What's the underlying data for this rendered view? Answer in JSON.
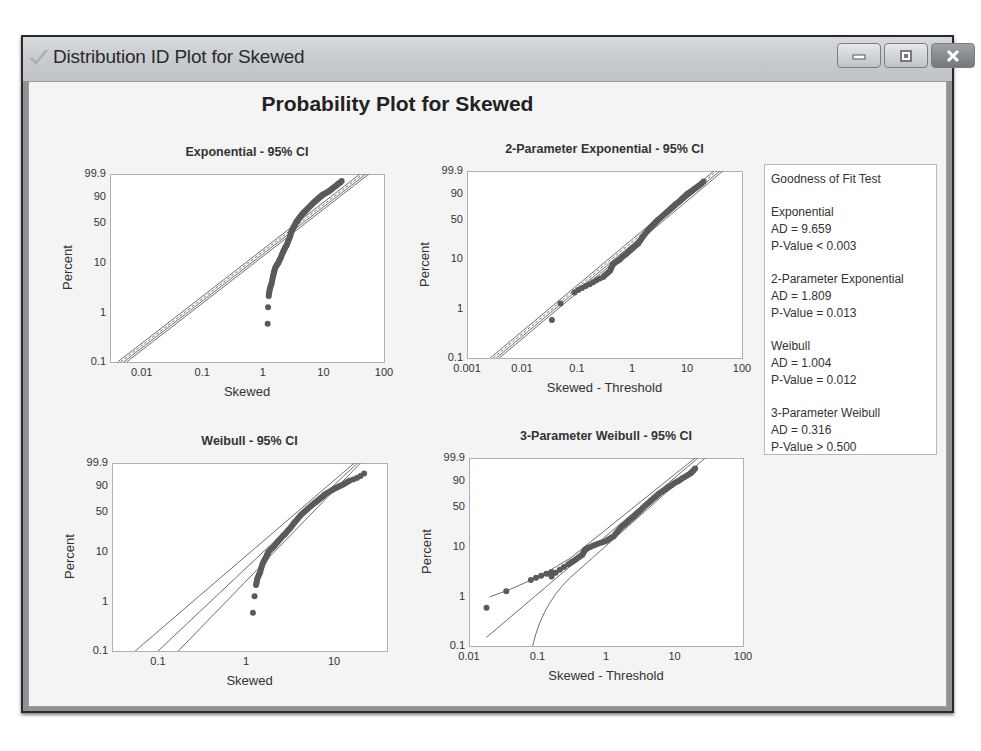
{
  "window": {
    "title": "Distribution ID Plot for Skewed",
    "icon": "checkmark-icon",
    "controls": {
      "minimize": "minimize-icon",
      "maximize": "maximize-icon",
      "close": "close-icon"
    }
  },
  "main_title": "Probability Plot for Skewed",
  "goodness_of_fit": {
    "title": "Goodness of Fit Test",
    "tests": [
      {
        "name": "Exponential",
        "ad": "AD = 9.659",
        "p": "P-Value < 0.003"
      },
      {
        "name": "2-Parameter Exponential",
        "ad": "AD = 1.809",
        "p": "P-Value = 0.013"
      },
      {
        "name": "Weibull",
        "ad": "AD = 1.004",
        "p": "P-Value = 0.012"
      },
      {
        "name": "3-Parameter Weibull",
        "ad": "AD = 0.316",
        "p": "P-Value > 0.500"
      }
    ]
  },
  "colors": {
    "points": "#5a5a5a",
    "lines": "#6e6e6e",
    "frame": "#b0b0b0"
  },
  "chart_data": [
    {
      "type": "scatter",
      "title": "Exponential - 95% CI",
      "xlabel": "Skewed",
      "ylabel": "Percent",
      "xscale": "log",
      "xlim": [
        0.003,
        100
      ],
      "xticks": [
        "0.01",
        "0.1",
        "1",
        "10",
        "100"
      ],
      "xtick_values": [
        0.01,
        0.1,
        1,
        10,
        100
      ],
      "yticks": [
        "0.1",
        "1",
        "10",
        "50",
        "90",
        "99.9"
      ],
      "ytick_values": [
        0.1,
        1,
        10,
        50,
        90,
        99.9
      ],
      "fit_line": {
        "x": [
          0.0045,
          45
        ],
        "note": "fitted line with narrow 95% CI band"
      },
      "points": [
        [
          1.2,
          0.6
        ],
        [
          1.22,
          1.3
        ],
        [
          1.25,
          2.2
        ],
        [
          1.3,
          3
        ],
        [
          1.4,
          4
        ],
        [
          1.5,
          6
        ],
        [
          1.6,
          8
        ],
        [
          1.8,
          10
        ],
        [
          2,
          13
        ],
        [
          2.2,
          17
        ],
        [
          2.5,
          22
        ],
        [
          2.8,
          30
        ],
        [
          3,
          38
        ],
        [
          3.3,
          45
        ],
        [
          3.6,
          52
        ],
        [
          4,
          58
        ],
        [
          4.5,
          65
        ],
        [
          5,
          70
        ],
        [
          6,
          78
        ],
        [
          7,
          84
        ],
        [
          8,
          88
        ],
        [
          9,
          91
        ],
        [
          10,
          93
        ],
        [
          12,
          95
        ],
        [
          14,
          97
        ],
        [
          17,
          98.5
        ],
        [
          20,
          99.3
        ]
      ]
    },
    {
      "type": "scatter",
      "title": "2-Parameter Exponential - 95% CI",
      "xlabel": "Skewed - Threshold",
      "ylabel": "Percent",
      "xscale": "log",
      "xlim": [
        0.001,
        100
      ],
      "xticks": [
        "0.001",
        "0.01",
        "0.1",
        "1",
        "10",
        "100"
      ],
      "xtick_values": [
        0.001,
        0.01,
        0.1,
        1,
        10,
        100
      ],
      "yticks": [
        "0.1",
        "1",
        "10",
        "50",
        "90",
        "99.9"
      ],
      "ytick_values": [
        0.1,
        1,
        10,
        50,
        90,
        99.9
      ],
      "fit_line": {
        "x": [
          0.003,
          35
        ],
        "note": "fitted line with narrow 95% CI band"
      },
      "points": [
        [
          0.035,
          0.6
        ],
        [
          0.05,
          1.3
        ],
        [
          0.09,
          2.2
        ],
        [
          0.17,
          3.2
        ],
        [
          0.3,
          4.5
        ],
        [
          0.4,
          6
        ],
        [
          0.45,
          8
        ],
        [
          0.6,
          10
        ],
        [
          0.8,
          13
        ],
        [
          1,
          16
        ],
        [
          1.3,
          20
        ],
        [
          1.6,
          27
        ],
        [
          2,
          35
        ],
        [
          2.5,
          43
        ],
        [
          3,
          50
        ],
        [
          4,
          60
        ],
        [
          5,
          68
        ],
        [
          6,
          75
        ],
        [
          8,
          84
        ],
        [
          10,
          90
        ],
        [
          12,
          93
        ],
        [
          15,
          96
        ],
        [
          20,
          98.5
        ]
      ]
    },
    {
      "type": "scatter",
      "title": "Weibull - 95% CI",
      "xlabel": "Skewed",
      "ylabel": "Percent",
      "xscale": "log",
      "xlim": [
        0.03,
        40
      ],
      "xticks": [
        "0.1",
        "1",
        "10"
      ],
      "xtick_values": [
        0.1,
        1,
        10
      ],
      "yticks": [
        "0.1",
        "1",
        "10",
        "50",
        "90",
        "99.9"
      ],
      "ytick_values": [
        0.1,
        1,
        10,
        50,
        90,
        99.9
      ],
      "fit_line": {
        "x": [
          0.1,
          18
        ],
        "note": "fitted line with wide 95% CI band at lower tail"
      },
      "points": [
        [
          1.2,
          0.6
        ],
        [
          1.25,
          1.3
        ],
        [
          1.3,
          2.2
        ],
        [
          1.35,
          3
        ],
        [
          1.45,
          4
        ],
        [
          1.55,
          6
        ],
        [
          1.7,
          8
        ],
        [
          1.8,
          10
        ],
        [
          2.1,
          13
        ],
        [
          2.4,
          17
        ],
        [
          2.8,
          22
        ],
        [
          3.2,
          28
        ],
        [
          3.6,
          35
        ],
        [
          4.2,
          45
        ],
        [
          5,
          55
        ],
        [
          6,
          65
        ],
        [
          7,
          73
        ],
        [
          8,
          80
        ],
        [
          10,
          87
        ],
        [
          12,
          91
        ],
        [
          15,
          95
        ],
        [
          22,
          98.5
        ]
      ]
    },
    {
      "type": "scatter",
      "title": "3-Parameter Weibull - 95% CI",
      "xlabel": "Skewed - Threshold",
      "ylabel": "Percent",
      "xscale": "log",
      "xlim": [
        0.01,
        100
      ],
      "xticks": [
        "0.01",
        "0.1",
        "1",
        "10",
        "100"
      ],
      "xtick_values": [
        0.01,
        0.1,
        1,
        10,
        100
      ],
      "yticks": [
        "0.1",
        "1",
        "10",
        "50",
        "90",
        "99.9"
      ],
      "ytick_values": [
        0.1,
        1,
        10,
        50,
        90,
        99.9
      ],
      "fit_line": {
        "x": [
          0.018,
          25
        ],
        "note": "fitted line with 95% CI band curving at lower tail"
      },
      "points": [
        [
          0.018,
          0.6
        ],
        [
          0.035,
          1.3
        ],
        [
          0.08,
          2.2
        ],
        [
          0.16,
          3.2
        ],
        [
          0.16,
          2.6
        ],
        [
          0.28,
          4.5
        ],
        [
          0.35,
          5.5
        ],
        [
          0.45,
          7
        ],
        [
          0.5,
          9
        ],
        [
          0.7,
          11
        ],
        [
          1,
          13
        ],
        [
          1.3,
          16
        ],
        [
          1.6,
          22
        ],
        [
          2,
          28
        ],
        [
          2.5,
          35
        ],
        [
          3,
          42
        ],
        [
          4,
          55
        ],
        [
          5,
          65
        ],
        [
          6,
          73
        ],
        [
          8,
          82
        ],
        [
          10,
          88
        ],
        [
          13,
          93
        ],
        [
          17,
          96.5
        ],
        [
          20,
          98.5
        ]
      ]
    }
  ]
}
